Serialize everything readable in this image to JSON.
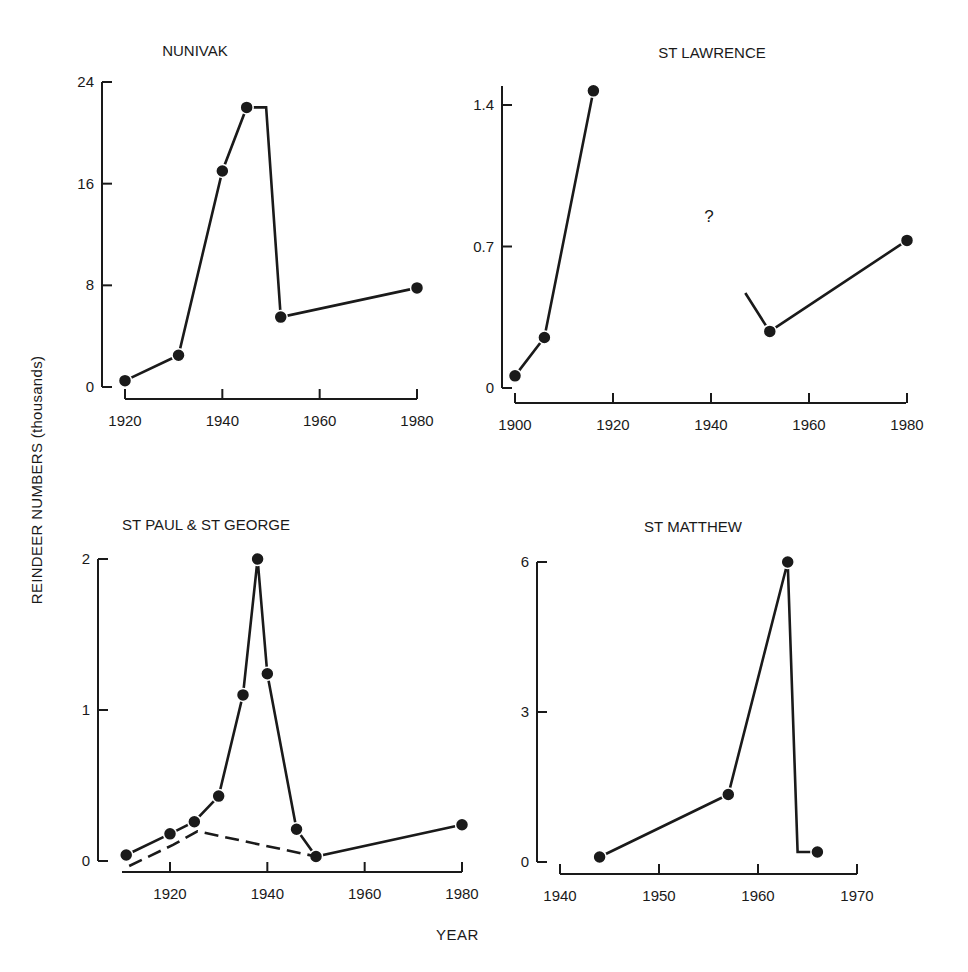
{
  "figure": {
    "ylabel": "REINDEER NUMBERS (thousands)",
    "xlabel": "YEAR",
    "ink_color": "#1a1a1a",
    "background": "#ffffff"
  },
  "chart_data": [
    {
      "type": "line",
      "title": "NUNIVAK",
      "xlabel": "YEAR",
      "ylabel": "REINDEER NUMBERS (thousands)",
      "xlim": [
        1920,
        1980
      ],
      "ylim": [
        0,
        24
      ],
      "xticks": [
        1920,
        1940,
        1960,
        1980
      ],
      "yticks": [
        0,
        8,
        16,
        24
      ],
      "ytick_labels": [
        "0",
        "8",
        "16",
        "24"
      ],
      "grid": false,
      "series": [
        {
          "name": "Nunivak",
          "style": "solid",
          "x": [
            1920,
            1931,
            1940,
            1945,
            1952,
            1980
          ],
          "y": [
            0.5,
            2.5,
            17,
            22,
            5.5,
            7.8
          ]
        }
      ],
      "annotations": [
        "Step drop: plateau at ~22 from 1945 to ~1949, then vertical fall to 1952 value"
      ]
    },
    {
      "type": "line",
      "title": "ST LAWRENCE",
      "xlabel": "YEAR",
      "ylabel": "REINDEER NUMBERS (thousands)",
      "xlim": [
        1900,
        1980
      ],
      "ylim": [
        0,
        1.4
      ],
      "xticks": [
        1900,
        1920,
        1940,
        1960,
        1980
      ],
      "xtick_labels": [
        "1900",
        "1920",
        "1940",
        "1960",
        "1980"
      ],
      "yticks": [
        0,
        0.7,
        1.4
      ],
      "ytick_labels": [
        "0",
        "0.7",
        "1.4"
      ],
      "grid": false,
      "series": [
        {
          "name": "St Lawrence (early)",
          "style": "solid",
          "x": [
            1900,
            1906,
            1916
          ],
          "y": [
            0.06,
            0.25,
            1.47
          ]
        },
        {
          "name": "St Lawrence (late)",
          "style": "solid",
          "x": [
            1952,
            1980
          ],
          "y": [
            0.28,
            0.73
          ],
          "lead_in_from": {
            "x": 1947,
            "y": 0.47
          }
        }
      ],
      "annotations": [
        {
          "text": "?",
          "x": 1940,
          "y": 0.85
        }
      ]
    },
    {
      "type": "line",
      "title": "ST PAUL & ST GEORGE",
      "xlabel": "YEAR",
      "ylabel": "REINDEER NUMBERS (thousands)",
      "xlim": [
        1911,
        1980
      ],
      "ylim": [
        0,
        2
      ],
      "xticks": [
        1920,
        1940,
        1960,
        1980
      ],
      "yticks": [
        0,
        1,
        2
      ],
      "ytick_labels": [
        "0",
        "1",
        "2"
      ],
      "grid": false,
      "series": [
        {
          "name": "St Paul",
          "style": "solid",
          "x": [
            1911,
            1920,
            1925,
            1930,
            1935,
            1938,
            1940,
            1946,
            1950,
            1980
          ],
          "y": [
            0.04,
            0.18,
            0.26,
            0.43,
            1.1,
            2.0,
            1.24,
            0.21,
            0.03,
            0.24
          ]
        },
        {
          "name": "St George",
          "style": "dashed",
          "x": [
            1911,
            1920,
            1925,
            1950
          ],
          "y": [
            0.0,
            0.14,
            0.23,
            0.03
          ]
        }
      ]
    },
    {
      "type": "line",
      "title": "ST MATTHEW",
      "xlabel": "YEAR",
      "ylabel": "REINDEER NUMBERS (thousands)",
      "xlim": [
        1940,
        1970
      ],
      "ylim": [
        0,
        6
      ],
      "xticks": [
        1940,
        1950,
        1960,
        1970
      ],
      "yticks": [
        0,
        3,
        6
      ],
      "ytick_labels": [
        "0",
        "3",
        "6"
      ],
      "grid": false,
      "series": [
        {
          "name": "St Matthew",
          "style": "solid",
          "x": [
            1944,
            1957,
            1963,
            1966
          ],
          "y": [
            0.1,
            1.35,
            6.0,
            0.2
          ]
        }
      ],
      "annotations": [
        "Crash: vertical fall after 1963 to ~0.2 by 1964, then horizontal to 1966 point"
      ]
    }
  ]
}
